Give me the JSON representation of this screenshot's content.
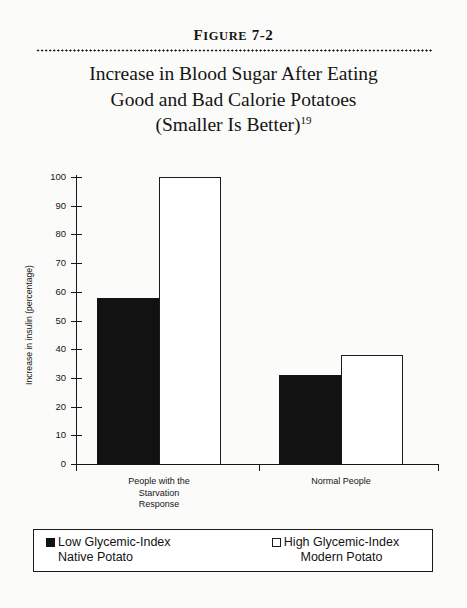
{
  "figure": {
    "label_full": "FIGURE 7-2",
    "label_cap": "F",
    "label_rest": "IGURE",
    "label_number": "7-2",
    "title_line1": "Increase in Blood Sugar After Eating",
    "title_line2": "Good and Bad Calorie Potatoes",
    "title_line3": "(Smaller Is Better)",
    "title_footnote": "19"
  },
  "chart_data": {
    "type": "bar",
    "title": "Increase in Blood Sugar After Eating Good and Bad Calorie Potatoes (Smaller Is Better)",
    "xlabel": "",
    "ylabel": "Increase in insulin (percentage)",
    "ylim": [
      0,
      100
    ],
    "ytick_values": [
      0,
      10,
      20,
      30,
      40,
      50,
      60,
      70,
      80,
      90,
      100
    ],
    "ytick_labels": [
      "0",
      "10",
      "20",
      "30",
      "40",
      "50",
      "60",
      "70",
      "80",
      "90",
      "100"
    ],
    "grid": false,
    "legend_position": "bottom",
    "categories": [
      "People with the Starvation Response",
      "Normal People"
    ],
    "category_label_lines": [
      [
        "People with the",
        "Starvation",
        "Response"
      ],
      [
        "Normal People"
      ]
    ],
    "series": [
      {
        "name": "Low Glycemic-Index Native Potato",
        "name_line1": "Low Glycemic-Index",
        "name_line2": "Native Potato",
        "marker": "filled-square",
        "color": "#121212",
        "values": [
          58,
          31
        ]
      },
      {
        "name": "High Glycemic-Index Modern Potato",
        "name_line1": "High Glycemic-Index",
        "name_line2": "Modern Potato",
        "marker": "open-square",
        "color": "#ffffff",
        "values": [
          100,
          38
        ]
      }
    ]
  },
  "colors": {
    "page_background": "#fbfbfa",
    "ink": "#171717",
    "bar_solid": "#121212",
    "bar_hollow_fill": "#ffffff",
    "bar_hollow_stroke": "#1b1b1b"
  }
}
